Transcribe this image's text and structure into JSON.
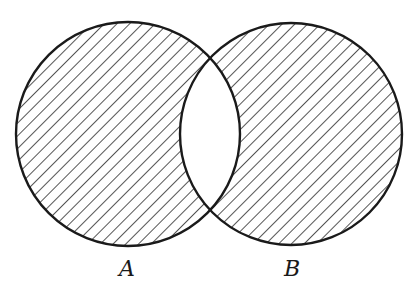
{
  "diagram": {
    "type": "venn",
    "sets": [
      {
        "label": "A",
        "shaded_exclusive": true
      },
      {
        "label": "B",
        "shaded_exclusive": true
      }
    ],
    "intersection_shaded": false,
    "colors": {
      "stroke": "#1a1a1a",
      "hatch": "#2a2a2a",
      "background": "#ffffff"
    }
  }
}
